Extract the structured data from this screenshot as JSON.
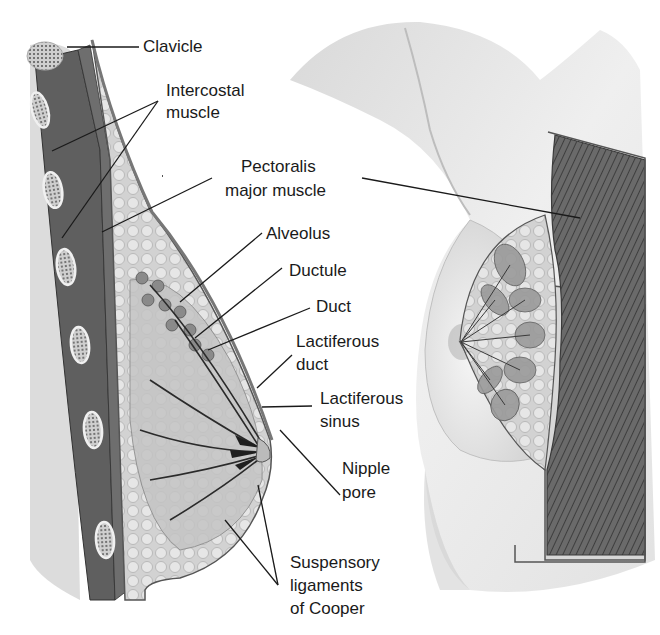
{
  "figure": {
    "labels": {
      "clavicle": "Clavicle",
      "intercostal_1": "Intercostal",
      "intercostal_2": "muscle",
      "pectoralis_1": "Pectoralis",
      "pectoralis_2": "major muscle",
      "alveolus": "Alveolus",
      "ductule": "Ductule",
      "duct": "Duct",
      "lactiferous_duct_1": "Lactiferous",
      "lactiferous_duct_2": "duct",
      "lactiferous_sinus_1": "Lactiferous",
      "lactiferous_sinus_2": "sinus",
      "nipple_pore_1": "Nipple",
      "nipple_pore_2": "pore",
      "cooper_1": "Suspensory",
      "cooper_2": "ligaments",
      "cooper_3": "of Cooper"
    },
    "colors": {
      "line": "#1a1a1a",
      "skin_light": "#ececec",
      "skin_mid": "#d4d4d4",
      "muscle_dark": "#5a5a5a",
      "tissue": "#c8c8c8",
      "bone": "#b8b8b8"
    }
  }
}
